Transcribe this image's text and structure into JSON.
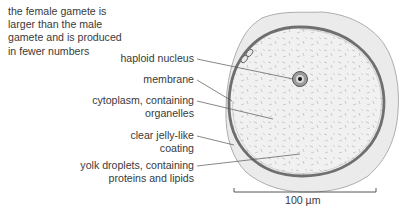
{
  "intro_text": {
    "lines": [
      "the female gamete is",
      "larger than the male",
      "gamete and is produced",
      "in fewer numbers"
    ]
  },
  "labels": [
    {
      "id": "haploid-nucleus",
      "lines": [
        "haploid nucleus"
      ]
    },
    {
      "id": "membrane",
      "lines": [
        "membrane"
      ]
    },
    {
      "id": "cytoplasm",
      "lines": [
        "cytoplasm, containing",
        "organelles"
      ]
    },
    {
      "id": "jelly-coating",
      "lines": [
        "clear jelly-like",
        "coating"
      ]
    },
    {
      "id": "yolk-droplets",
      "lines": [
        "yolk droplets, containing",
        "proteins and lipids"
      ]
    }
  ],
  "scale_bar": {
    "label": "100 µm"
  },
  "colors": {
    "text": "#3a3a3a",
    "jelly_fill": "#ebebeb",
    "jelly_outline": "#9a9a9a",
    "cytoplasm_fill": "#f0f0f0",
    "membrane": "#6f6f6f",
    "nucleus_fill": "#9b9b9b",
    "nucleolus": "#111111",
    "leader_line": "#555555"
  }
}
